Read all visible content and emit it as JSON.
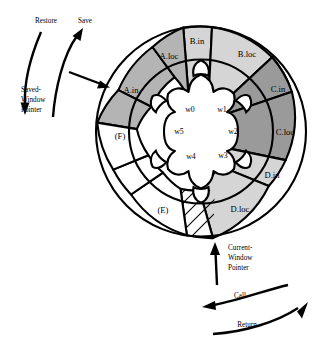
{
  "figure": {
    "geometry": {
      "center_x": 201,
      "center_y": 131.5,
      "outer_radius": 105,
      "mid_radius": 72,
      "inner_radius": 57,
      "scallop_radius": 44
    },
    "colors": {
      "dark_gray": "#9a9a9a",
      "medium_gray": "#b4b4b4",
      "light_gray": "#d5d5d5",
      "white": "#ffffff",
      "stroke": "#000000"
    }
  },
  "ring_segments": [
    {
      "id": "b-in",
      "label": "B.in",
      "fill": "#d5d5d5",
      "start_deg": -13,
      "end_deg": 13,
      "band": "outer",
      "label_r": 88
    },
    {
      "id": "b-loc",
      "label": "B.loc",
      "fill": "#d5d5d5",
      "start_deg": 13,
      "end_deg": 57,
      "band": "outer",
      "label_r": 88
    },
    {
      "id": "c-in",
      "label": "C.in",
      "fill": "#9a9a9a",
      "start_deg": 57,
      "end_deg": 83,
      "band": "outer",
      "label_r": 88
    },
    {
      "id": "c-loc",
      "label": "C.loc",
      "fill": "#9a9a9a",
      "start_deg": 83,
      "end_deg": 127,
      "band": "outer",
      "label_r": 88
    },
    {
      "id": "d-in",
      "label": "D.in",
      "fill": "#d5d5d5",
      "start_deg": 127,
      "end_deg": 153,
      "band": "outer",
      "label_r": 88
    },
    {
      "id": "d-loc",
      "label": "D.loc",
      "fill": "#d5d5d5",
      "start_deg": 153,
      "end_deg": 197,
      "band": "outer",
      "label_r": 88
    },
    {
      "id": "d-out",
      "label": "",
      "fill": "#ffffff",
      "start_deg": 197,
      "end_deg": 223,
      "band": "outer",
      "label_r": 88,
      "hatched": true
    },
    {
      "id": "e-loc",
      "label": "(E)",
      "fill": "#ffffff",
      "start_deg": 223,
      "end_deg": 267,
      "band": "outer",
      "label_r": 88
    },
    {
      "id": "e-in",
      "label": "",
      "fill": "#ffffff",
      "start_deg": 267,
      "end_deg": 293,
      "band": "outer",
      "label_r": 88
    },
    {
      "id": "f-loc",
      "label": "(F)",
      "fill": "#ffffff",
      "start_deg": 293,
      "end_deg": 337,
      "band": "outer",
      "label_r": 88
    },
    {
      "id": "a-in",
      "label": "A.in",
      "fill": "#b4b4b4",
      "start_deg": 307,
      "end_deg": 333,
      "band": "outer",
      "label_r": 88
    },
    {
      "id": "a-loc",
      "label": "A.loc",
      "fill": "#b4b4b4",
      "start_deg": 333,
      "end_deg": 377,
      "band": "outer",
      "label_r": 88
    }
  ],
  "window_labels": [
    {
      "id": "w0",
      "label": "w0",
      "x": 183,
      "y": 110
    },
    {
      "id": "w1",
      "label": "w1",
      "x": 220,
      "y": 110
    },
    {
      "id": "w2",
      "label": "w2",
      "x": 233,
      "y": 131
    },
    {
      "id": "w3",
      "label": "w3",
      "x": 220,
      "y": 155
    },
    {
      "id": "w4",
      "label": "w4",
      "x": 184,
      "y": 155
    },
    {
      "id": "w5",
      "label": "w5",
      "x": 174,
      "y": 131
    }
  ],
  "annotations": {
    "restore": {
      "label": "Restore",
      "x": 48,
      "y": 21
    },
    "save": {
      "label": "Save",
      "x": 85,
      "y": 22
    },
    "saved_window_pointer": {
      "line1": "Saved-",
      "line2": "Window",
      "line3": "Pointer",
      "x": 31,
      "y": 95
    },
    "current_window_pointer": {
      "line1": "Current-",
      "line2": "Window",
      "line3": "Pointer",
      "x": 232,
      "y": 250
    },
    "call": {
      "label": "Call",
      "x": 239,
      "y": 296
    },
    "return": {
      "label": "Return",
      "x": 246,
      "y": 325
    }
  }
}
